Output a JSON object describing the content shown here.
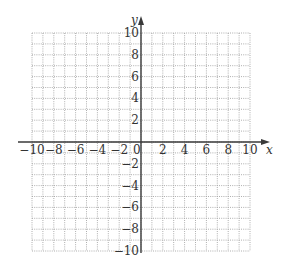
{
  "graph": {
    "type": "coordinate-grid",
    "x_axis_label": "x",
    "y_axis_label": "y",
    "x_range": [
      -10,
      10
    ],
    "y_range": [
      -10,
      10
    ],
    "grid_step": 1,
    "label_step": 2,
    "origin_label": "0",
    "x_tick_labels": [
      "-10",
      "-8",
      "-6",
      "-4",
      "-2",
      "2",
      "4",
      "6",
      "8",
      "10"
    ],
    "y_tick_labels": [
      "10",
      "8",
      "6",
      "4",
      "2",
      "-2",
      "-4",
      "-6",
      "-8",
      "-10"
    ],
    "colors": {
      "grid": "#9a9a9a",
      "axis": "#3a3a3a",
      "text": "#333333",
      "background": "#ffffff"
    }
  }
}
